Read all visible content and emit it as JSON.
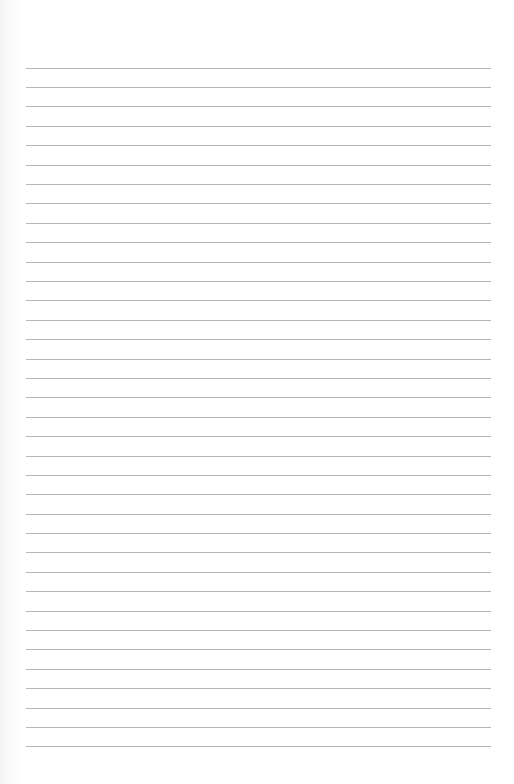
{
  "page": {
    "type": "lined-paper",
    "background_color": "#ffffff",
    "rule_color": "#a9a9a9",
    "rule_count": 36,
    "first_rule_y": 67.7,
    "rule_spacing": 19.39,
    "rule_left": 26,
    "rule_right": 491,
    "text": ""
  }
}
